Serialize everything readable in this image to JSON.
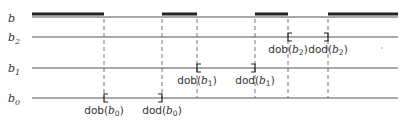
{
  "diagram": {
    "rows": [
      {
        "id": "b",
        "label": "b",
        "sub": "",
        "y": 17
      },
      {
        "id": "b2",
        "label": "b",
        "sub": "2",
        "y": 37
      },
      {
        "id": "b1",
        "label": "b",
        "sub": "1",
        "y": 68
      },
      {
        "id": "b0",
        "label": "b",
        "sub": "0",
        "y": 98
      }
    ],
    "x_start": 32,
    "x_end": 398,
    "b_thick_segments": [
      [
        32,
        104
      ],
      [
        162,
        197
      ],
      [
        255,
        288
      ],
      [
        328,
        398
      ]
    ],
    "dashed_x": [
      104,
      162,
      197,
      255,
      288,
      328
    ],
    "intervals": [
      {
        "row": "b0",
        "dob_x": 104,
        "dod_x": 162,
        "dob_label": "dob",
        "dod_label": "dod",
        "arg": "b",
        "sub": "0"
      },
      {
        "row": "b1",
        "dob_x": 197,
        "dod_x": 255,
        "dob_label": "dob",
        "dod_label": "dod",
        "arg": "b",
        "sub": "1"
      },
      {
        "row": "b2",
        "dob_x": 288,
        "dod_x": 328,
        "dob_label": "dob",
        "dod_label": "dod",
        "arg": "b",
        "sub": "2"
      }
    ],
    "colors": {
      "line": "#555555",
      "thick": "#222222",
      "text": "#333333"
    }
  }
}
